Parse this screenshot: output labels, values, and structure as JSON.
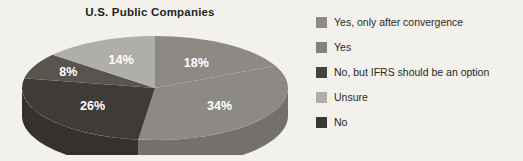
{
  "chart_data": {
    "type": "pie",
    "title": "U.S. Public Companies",
    "categories": [
      "Yes, only after convergence",
      "Yes",
      "No, but IFRS should be an option",
      "No",
      "Unsure"
    ],
    "values": [
      18,
      34,
      26,
      8,
      14
    ],
    "data_labels": [
      "18%",
      "34%",
      "26%",
      "8%",
      "14%"
    ],
    "units": "percent",
    "colors": [
      "#8d8a85",
      "#8d8a85",
      "#3f3c38",
      "#58554f",
      "#b0aea9"
    ],
    "legend_position": "right",
    "grid": false,
    "xlabel": "",
    "ylabel": ""
  },
  "chart": {
    "title": "U.S. Public Companies",
    "slices": [
      {
        "label": "18%",
        "name": "Yes, only after convergence",
        "value": 18,
        "color": "#8d8a85"
      },
      {
        "label": "34%",
        "name": "Yes",
        "value": 34,
        "color": "#8d8a85"
      },
      {
        "label": "26%",
        "name": "No, but IFRS should be an option",
        "value": 26,
        "color": "#3f3c38"
      },
      {
        "label": "8%",
        "name": "No",
        "value": 8,
        "color": "#58554f"
      },
      {
        "label": "14%",
        "name": "Unsure",
        "value": 14,
        "color": "#b0aea9"
      }
    ]
  },
  "legend": {
    "items": [
      {
        "label": "Yes, only after convergence",
        "color": "#8d8a85"
      },
      {
        "label": "Yes",
        "color": "#83807b"
      },
      {
        "label": "No, but IFRS should be an option",
        "color": "#46433f"
      },
      {
        "label": "Unsure",
        "color": "#b0aea9"
      },
      {
        "label": "No",
        "color": "#3c3935"
      }
    ]
  },
  "colors": {
    "background": "#f3f1ec",
    "title_text": "#231f1c",
    "legend_text": "#2b2724",
    "label_text": "#ffffff"
  }
}
